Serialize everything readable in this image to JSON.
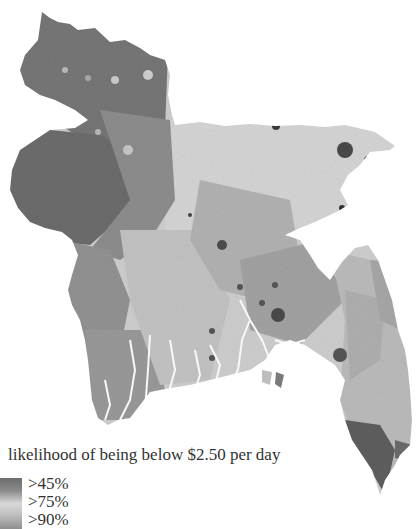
{
  "map": {
    "region": "Bangladesh",
    "type": "choropleth",
    "colors": {
      "high_poverty_dark": "#6a6a6a",
      "mid": "#a0a0a0",
      "light": "#d9d9d9",
      "urban_dark": "#3f3f3f",
      "background": "#ffffff"
    }
  },
  "legend": {
    "title": "likelihood of being below $2.50 per day",
    "items": [
      {
        "label": ">45%"
      },
      {
        "label": ">75%"
      },
      {
        "label": ">90%"
      }
    ]
  }
}
